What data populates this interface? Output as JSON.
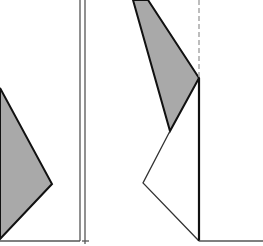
{
  "diagram": {
    "width": 263,
    "height": 246,
    "colors": {
      "fill": "#a9a9a9",
      "stroke": "#111111",
      "thin_line": "#555555",
      "dashed": "#9a9a9a",
      "background": "#ffffff"
    },
    "left_shaded_polygon": "0,88 52,184 0,239",
    "double_lines": [
      {
        "x": 80,
        "y1": 0,
        "y2": 241
      },
      {
        "x": 85,
        "y1": 0,
        "y2": 244
      }
    ],
    "left_baseline": {
      "x1": 0,
      "y1": 241,
      "x2": 80,
      "y2": 241
    },
    "right_tick": {
      "x1": 82,
      "y1": 241,
      "x2": 89,
      "y2": 241
    },
    "right_shaded_polygon": "133,0 148,0 199,78 170,131",
    "right_outline_polyline": "170,131 143,183 199,241",
    "dashed_axis": {
      "x": 199,
      "y1": 0,
      "y2": 78
    },
    "solid_axis": {
      "x": 199,
      "y1": 78,
      "y2": 241
    },
    "right_baseline": {
      "x1": 199,
      "y1": 241,
      "x2": 263,
      "y2": 241
    }
  }
}
